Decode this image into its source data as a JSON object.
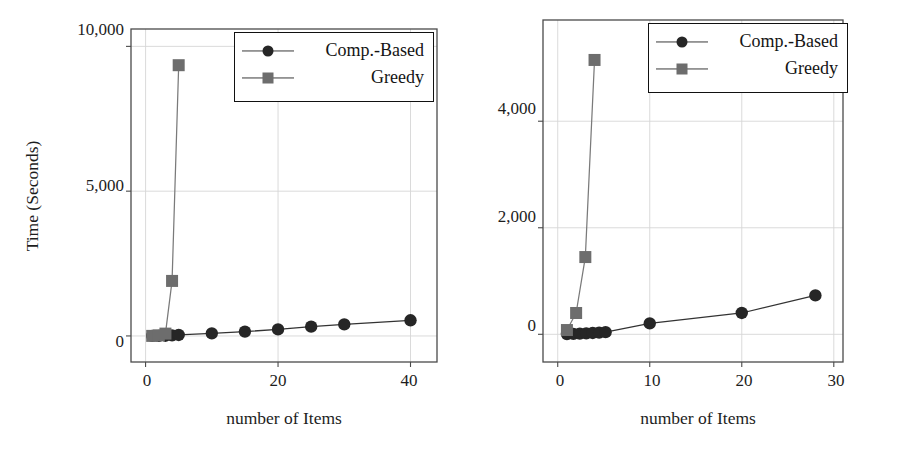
{
  "figure": {
    "title": "",
    "panels": [
      "left",
      "right"
    ]
  },
  "legend": {
    "series": [
      {
        "key": "comp_based",
        "label": "Comp.-Based",
        "marker": "circle-marker-icon",
        "color": "#262626"
      },
      {
        "key": "greedy",
        "label": "Greedy",
        "marker": "square-marker-icon",
        "color": "#6d6d6d"
      }
    ]
  },
  "chart_data": [
    {
      "panel": "left",
      "type": "line",
      "title": "",
      "xlabel": "number of Items",
      "ylabel": "Time (Seconds)",
      "xlim": [
        -2.2,
        44
      ],
      "ylim": [
        -900,
        10600
      ],
      "xticks": [
        0,
        20,
        40
      ],
      "xtick_labels": [
        "0",
        "20",
        "40"
      ],
      "yticks": [
        0,
        5000,
        10000
      ],
      "ytick_labels": [
        "0",
        "5,000",
        "10,000"
      ],
      "grid": true,
      "legend_position": "top-right",
      "series": [
        {
          "name": "Comp.-Based",
          "marker": "circle",
          "color": "#262626",
          "x": [
            1,
            2,
            3,
            4,
            5,
            10,
            15,
            20,
            25,
            30,
            40
          ],
          "y": [
            1,
            3,
            8,
            18,
            35,
            90,
            150,
            225,
            320,
            400,
            540
          ]
        },
        {
          "name": "Greedy",
          "marker": "square",
          "color": "#6d6d6d",
          "x": [
            1,
            2,
            3,
            4,
            5
          ],
          "y": [
            2,
            20,
            80,
            400,
            1900,
            9350
          ],
          "x_points": [
            1,
            2,
            3,
            4,
            5
          ],
          "y_points": [
            2,
            20,
            80,
            1900,
            9350
          ]
        }
      ]
    },
    {
      "panel": "right",
      "type": "line",
      "title": "",
      "xlabel": "number of Items",
      "ylabel": "",
      "xlim": [
        -1.6,
        31
      ],
      "ylim": [
        -520,
        5900
      ],
      "xticks": [
        0,
        10,
        20,
        30
      ],
      "xtick_labels": [
        "0",
        "10",
        "20",
        "30"
      ],
      "yticks": [
        0,
        2000,
        4000
      ],
      "ytick_labels": [
        "0",
        "2,000",
        "4,000"
      ],
      "grid": true,
      "legend_position": "top-right",
      "series": [
        {
          "name": "Comp.-Based",
          "marker": "circle",
          "color": "#262626",
          "x": [
            1,
            1.7,
            2.4,
            3.1,
            3.8,
            4.5,
            5.2,
            10,
            20,
            28
          ],
          "y": [
            5,
            8,
            12,
            18,
            25,
            32,
            40,
            205,
            400,
            730
          ]
        },
        {
          "name": "Greedy",
          "marker": "square",
          "color": "#6d6d6d",
          "x": [
            1,
            2,
            3,
            4
          ],
          "y": [
            80,
            400,
            1450,
            5150
          ]
        }
      ]
    }
  ]
}
